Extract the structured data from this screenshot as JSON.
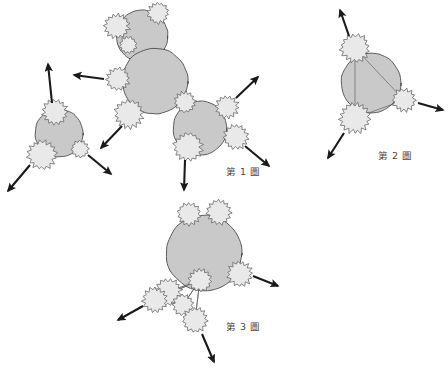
{
  "page": {
    "background_color": "#ffffff",
    "width": 448,
    "height": 374,
    "document_type": "patent-figure-sheet",
    "language": "zh-Hant"
  },
  "palette": {
    "cell_fill": "#c9c9c9",
    "cell_stroke": "#4d4d4d",
    "satellite_fill": "#e9e9e9",
    "satellite_stroke": "#6b6b6b",
    "arrow_color": "#1a1a1a",
    "link_line_color": "#555555",
    "caption_color": "#4a4a4a"
  },
  "captions": [
    {
      "id": "fig1",
      "text": "第 1 圖",
      "x": 226,
      "y": 164
    },
    {
      "id": "fig2",
      "text": "第 2 圖",
      "x": 378,
      "y": 148
    },
    {
      "id": "fig3",
      "text": "第 3 圖",
      "x": 226,
      "y": 319
    }
  ],
  "figures": [
    {
      "id": "fig1",
      "caption": "第 1 圖",
      "description": "Three cell bodies each bearing spiked satellite particles, with arrows indicating outward release",
      "cells": [
        {
          "id": "f1-cell-a",
          "cx": 59,
          "cy": 133,
          "r": 24
        },
        {
          "id": "f1-cell-b",
          "cx": 142,
          "cy": 36,
          "r": 26
        },
        {
          "id": "f1-cell-c",
          "cx": 155,
          "cy": 81,
          "r": 33
        },
        {
          "id": "f1-cell-d",
          "cx": 200,
          "cy": 128,
          "r": 27
        }
      ],
      "satellites": [
        {
          "id": "f1-sat-1",
          "cx": 55,
          "cy": 112,
          "r": 13,
          "teeth": 15
        },
        {
          "id": "f1-sat-2",
          "cx": 42,
          "cy": 155,
          "r": 15,
          "teeth": 16
        },
        {
          "id": "f1-sat-3",
          "cx": 80,
          "cy": 149,
          "r": 9,
          "teeth": 12
        },
        {
          "id": "f1-sat-4",
          "cx": 117,
          "cy": 26,
          "r": 13,
          "teeth": 15
        },
        {
          "id": "f1-sat-5",
          "cx": 128,
          "cy": 45,
          "r": 9,
          "teeth": 12
        },
        {
          "id": "f1-sat-6",
          "cx": 158,
          "cy": 13,
          "r": 11,
          "teeth": 14
        },
        {
          "id": "f1-sat-7",
          "cx": 118,
          "cy": 79,
          "r": 12,
          "teeth": 14
        },
        {
          "id": "f1-sat-8",
          "cx": 129,
          "cy": 114,
          "r": 15,
          "teeth": 16
        },
        {
          "id": "f1-sat-9",
          "cx": 185,
          "cy": 102,
          "r": 11,
          "teeth": 14
        },
        {
          "id": "f1-sat-10",
          "cx": 188,
          "cy": 147,
          "r": 15,
          "teeth": 16
        },
        {
          "id": "f1-sat-11",
          "cx": 227,
          "cy": 107,
          "r": 12,
          "teeth": 14
        },
        {
          "id": "f1-sat-12",
          "cx": 236,
          "cy": 137,
          "r": 13,
          "teeth": 15
        }
      ],
      "arrows": [
        {
          "id": "f1-arr-1",
          "x1": 52,
          "y1": 103,
          "x2": 48,
          "y2": 64
        },
        {
          "id": "f1-arr-2",
          "x1": 30,
          "y1": 165,
          "x2": 8,
          "y2": 191
        },
        {
          "id": "f1-arr-3",
          "x1": 88,
          "y1": 155,
          "x2": 111,
          "y2": 174
        },
        {
          "id": "f1-arr-4",
          "x1": 104,
          "y1": 79,
          "x2": 74,
          "y2": 75
        },
        {
          "id": "f1-arr-5",
          "x1": 122,
          "y1": 126,
          "x2": 101,
          "y2": 148
        },
        {
          "id": "f1-arr-6",
          "x1": 236,
          "y1": 98,
          "x2": 258,
          "y2": 77
        },
        {
          "id": "f1-arr-7",
          "x1": 245,
          "y1": 146,
          "x2": 269,
          "y2": 166
        },
        {
          "id": "f1-arr-8",
          "x1": 185,
          "y1": 160,
          "x2": 184,
          "y2": 190
        }
      ]
    },
    {
      "id": "fig2",
      "caption": "第 2 圖",
      "description": "Single large cell body with three spiked satellites interconnected by straight link lines forming a triangle",
      "cells": [
        {
          "id": "f2-cell-a",
          "cx": 371,
          "cy": 83,
          "r": 30
        }
      ],
      "satellites": [
        {
          "id": "f2-sat-1",
          "cx": 355,
          "cy": 48,
          "r": 15,
          "teeth": 16
        },
        {
          "id": "f2-sat-2",
          "cx": 404,
          "cy": 100,
          "r": 12,
          "teeth": 14
        },
        {
          "id": "f2-sat-3",
          "cx": 355,
          "cy": 118,
          "r": 16,
          "teeth": 17
        }
      ],
      "links": [
        {
          "id": "f2-link-1",
          "x1": 355,
          "y1": 48,
          "x2": 404,
          "y2": 100
        },
        {
          "id": "f2-link-2",
          "x1": 404,
          "y1": 100,
          "x2": 355,
          "y2": 118
        },
        {
          "id": "f2-link-3",
          "x1": 355,
          "y1": 118,
          "x2": 355,
          "y2": 48
        }
      ],
      "arrows": [
        {
          "id": "f2-arr-1",
          "x1": 349,
          "y1": 36,
          "x2": 340,
          "y2": 10
        },
        {
          "id": "f2-arr-2",
          "x1": 418,
          "y1": 103,
          "x2": 443,
          "y2": 110
        },
        {
          "id": "f2-arr-3",
          "x1": 344,
          "y1": 133,
          "x2": 328,
          "y2": 158
        }
      ]
    },
    {
      "id": "fig3",
      "caption": "第 3 圖",
      "description": "Large cell body with satellites above and a dense interconnected satellite cluster below left joined by link lines",
      "cells": [
        {
          "id": "f3-cell-a",
          "cx": 204,
          "cy": 253,
          "r": 38
        }
      ],
      "satellites": [
        {
          "id": "f3-sat-1",
          "cx": 189,
          "cy": 214,
          "r": 12,
          "teeth": 14
        },
        {
          "id": "f3-sat-2",
          "cx": 219,
          "cy": 212,
          "r": 13,
          "teeth": 15
        },
        {
          "id": "f3-sat-3",
          "cx": 240,
          "cy": 274,
          "r": 13,
          "teeth": 15
        },
        {
          "id": "f3-sat-4",
          "cx": 200,
          "cy": 280,
          "r": 12,
          "teeth": 14
        },
        {
          "id": "f3-sat-5",
          "cx": 168,
          "cy": 292,
          "r": 14,
          "teeth": 16
        },
        {
          "id": "f3-sat-6",
          "cx": 155,
          "cy": 300,
          "r": 13,
          "teeth": 15
        },
        {
          "id": "f3-sat-7",
          "cx": 183,
          "cy": 305,
          "r": 11,
          "teeth": 13
        },
        {
          "id": "f3-sat-8",
          "cx": 195,
          "cy": 320,
          "r": 13,
          "teeth": 15
        }
      ],
      "links": [
        {
          "id": "f3-link-1",
          "x1": 200,
          "y1": 280,
          "x2": 155,
          "y2": 300
        },
        {
          "id": "f3-link-2",
          "x1": 200,
          "y1": 280,
          "x2": 168,
          "y2": 292
        },
        {
          "id": "f3-link-3",
          "x1": 200,
          "y1": 280,
          "x2": 183,
          "y2": 305
        },
        {
          "id": "f3-link-4",
          "x1": 200,
          "y1": 280,
          "x2": 195,
          "y2": 320
        },
        {
          "id": "f3-link-5",
          "x1": 155,
          "y1": 300,
          "x2": 183,
          "y2": 305
        },
        {
          "id": "f3-link-6",
          "x1": 183,
          "y1": 305,
          "x2": 195,
          "y2": 320
        },
        {
          "id": "f3-link-7",
          "x1": 155,
          "y1": 300,
          "x2": 168,
          "y2": 292
        }
      ],
      "arrows": [
        {
          "id": "f3-arr-1",
          "x1": 253,
          "y1": 276,
          "x2": 278,
          "y2": 286
        },
        {
          "id": "f3-arr-2",
          "x1": 143,
          "y1": 306,
          "x2": 118,
          "y2": 320
        },
        {
          "id": "f3-arr-3",
          "x1": 202,
          "y1": 334,
          "x2": 214,
          "y2": 362
        }
      ]
    }
  ]
}
